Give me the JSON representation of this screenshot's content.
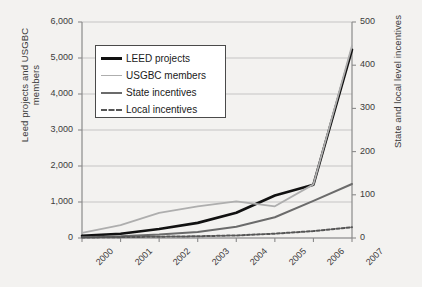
{
  "chart_data": {
    "type": "line",
    "title": "",
    "xlabel": "",
    "ylabel": "Leed projects and USGBC\nmembers",
    "y2label": "State and local level incentives",
    "x": [
      2000,
      2001,
      2002,
      2003,
      2004,
      2005,
      2006,
      2007
    ],
    "categories": [
      "2000",
      "2001",
      "2002",
      "2003",
      "2004",
      "2005",
      "2006",
      "2007"
    ],
    "ylim": [
      0,
      6000
    ],
    "y2lim": [
      0,
      500
    ],
    "yticks": [
      "0",
      "1,000",
      "2,000",
      "3,000",
      "4,000",
      "5,000",
      "6,000"
    ],
    "ytick_values": [
      0,
      1000,
      2000,
      3000,
      4000,
      5000,
      6000
    ],
    "y2ticks": [
      "0",
      "100",
      "200",
      "300",
      "400",
      "500"
    ],
    "y2tick_values": [
      0,
      100,
      200,
      300,
      400,
      500
    ],
    "grid": true,
    "legend_position": "upper left",
    "series": [
      {
        "name": "LEED projects",
        "axis": "left",
        "color": "#111111",
        "style": "solid",
        "width": 2.6,
        "values": [
          60,
          120,
          250,
          420,
          700,
          1180,
          1480,
          5230
        ]
      },
      {
        "name": "USGBC members",
        "axis": "left",
        "color": "#aeaeae",
        "style": "solid",
        "width": 1.8,
        "values": [
          140,
          360,
          700,
          880,
          1020,
          880,
          1490,
          5340
        ]
      },
      {
        "name": "State incentives",
        "axis": "right",
        "color": "#6b6b6b",
        "style": "solid",
        "width": 2.0,
        "values": [
          2,
          4,
          8,
          14,
          26,
          48,
          86,
          125
        ]
      },
      {
        "name": "Local incentives",
        "axis": "right",
        "color": "#555555",
        "style": "dashed",
        "width": 2.0,
        "values": [
          1,
          2,
          3,
          4,
          6,
          10,
          16,
          25
        ]
      }
    ]
  },
  "legend": {
    "items": [
      {
        "label": "LEED projects"
      },
      {
        "label": "USGBC members"
      },
      {
        "label": "State incentives"
      },
      {
        "label": "Local incentives"
      }
    ]
  }
}
